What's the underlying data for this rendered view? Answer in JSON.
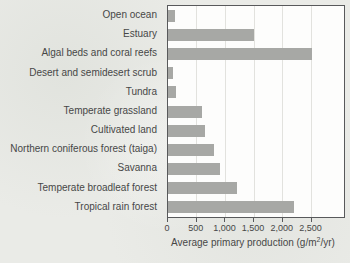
{
  "colors": {
    "page_background": "#eaebe7",
    "plot_background": "#fdfdfc",
    "bar": "#a7a8a5",
    "gridline": "#e2e2de",
    "axis_border": "#58595b",
    "text": "#474747"
  },
  "chart_data": {
    "type": "bar",
    "orientation": "horizontal",
    "title": "",
    "xlabel": "Average primary production (g/m2/yr)",
    "xlabel_parts": {
      "pre": "Average primary production (g/m",
      "sup": "2",
      "post": "/yr)"
    },
    "ylabel": "",
    "categories": [
      "Open ocean",
      "Estuary",
      "Algal beds and coral reefs",
      "Desert and semidesert scrub",
      "Tundra",
      "Temperate grassland",
      "Cultivated land",
      "Northern coniferous forest (taiga)",
      "Savanna",
      "Temperate broadleaf forest",
      "Tropical rain forest"
    ],
    "values": [
      125,
      1500,
      2500,
      90,
      140,
      600,
      650,
      800,
      900,
      1200,
      2200
    ],
    "x_ticks": [
      {
        "value": 0,
        "label": "0"
      },
      {
        "value": 500,
        "label": "500"
      },
      {
        "value": 1000,
        "label": "1,000"
      },
      {
        "value": 1500,
        "label": "1,500"
      },
      {
        "value": 2000,
        "label": "2,000"
      },
      {
        "value": 2500,
        "label": "2,500"
      }
    ],
    "xlim": [
      0,
      3065
    ],
    "grid": true,
    "legend": false
  }
}
